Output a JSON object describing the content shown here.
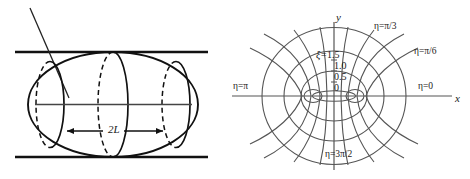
{
  "figure": {
    "background_color": "#ffffff",
    "stroke_color": "#1a1a1a",
    "grid_color": "#555555"
  },
  "left_panel": {
    "name": "ellipsoid-between-plates-diagram",
    "dimension_label": "2L",
    "plates": {
      "top_line_y": 52,
      "bottom_line_y": 157,
      "x_start": 15,
      "x_end": 208
    },
    "ellipsoid": {
      "center_x": 113,
      "center_y": 104,
      "semi_major": 85,
      "semi_minor": 52
    },
    "cross_sections": [
      {
        "cx": 50,
        "ry": 43
      },
      {
        "cx": 113,
        "ry": 52
      },
      {
        "cx": 176,
        "ry": 43
      }
    ],
    "axis_line": {
      "x1": 33,
      "x2": 193,
      "y": 104
    },
    "diagonal_line": {
      "x1": 30,
      "y1": 8,
      "x2": 68,
      "y2": 96
    }
  },
  "right_panel": {
    "name": "elliptic-coordinates-diagram",
    "axis_labels": {
      "x": "x",
      "y": "y"
    },
    "xi_label_prefix": "ξ=",
    "xi_values": [
      "1.5",
      "1.0",
      "0.5",
      "0"
    ],
    "eta_labels": [
      {
        "text": "η=π/3",
        "x": 374,
        "y": 26
      },
      {
        "text": "η=π/6",
        "x": 414,
        "y": 52
      },
      {
        "text": "η=0",
        "x": 420,
        "y": 84
      },
      {
        "text": "η=π",
        "x": 236,
        "y": 84
      },
      {
        "text": "η=3π/2",
        "x": 327,
        "y": 152
      }
    ],
    "origin": {
      "x": 334,
      "y": 96
    },
    "focus_half_distance": 21,
    "ellipses": [
      {
        "rx": 21.5,
        "ry": 5
      },
      {
        "rx": 36,
        "ry": 29
      },
      {
        "rx": 52,
        "ry": 47
      },
      {
        "rx": 72,
        "ry": 69
      },
      {
        "rx": 97,
        "ry": 95
      }
    ]
  }
}
